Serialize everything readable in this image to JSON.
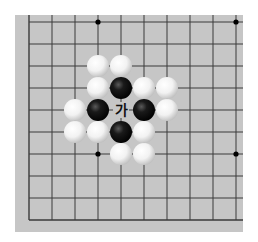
{
  "board": {
    "background_color": "#c6c6c6",
    "line_color": "#3a3a3a",
    "origin": {
      "x": 29,
      "y": 22
    },
    "spacing": {
      "x": 23,
      "y": 22
    },
    "columns": 10,
    "rows": 10,
    "edges": {
      "left": true,
      "top": false,
      "right": false,
      "bottom": true
    },
    "star_points": [
      {
        "col": 3,
        "row": 0
      },
      {
        "col": 9,
        "row": 0
      },
      {
        "col": 3,
        "row": 6
      },
      {
        "col": 9,
        "row": 6
      }
    ]
  },
  "stones": [
    {
      "color": "white",
      "col": 3,
      "row": 2
    },
    {
      "color": "white",
      "col": 4,
      "row": 2
    },
    {
      "color": "white",
      "col": 3,
      "row": 3
    },
    {
      "color": "black",
      "col": 4,
      "row": 3
    },
    {
      "color": "white",
      "col": 5,
      "row": 3
    },
    {
      "color": "white",
      "col": 6,
      "row": 3
    },
    {
      "color": "white",
      "col": 2,
      "row": 4
    },
    {
      "color": "black",
      "col": 3,
      "row": 4
    },
    {
      "color": "black",
      "col": 5,
      "row": 4
    },
    {
      "color": "white",
      "col": 6,
      "row": 4
    },
    {
      "color": "white",
      "col": 2,
      "row": 5
    },
    {
      "color": "white",
      "col": 3,
      "row": 5
    },
    {
      "color": "black",
      "col": 4,
      "row": 5
    },
    {
      "color": "white",
      "col": 5,
      "row": 5
    },
    {
      "color": "white",
      "col": 4,
      "row": 6
    },
    {
      "color": "white",
      "col": 5,
      "row": 6
    }
  ],
  "labels": [
    {
      "text": "가",
      "col": 4,
      "row": 4
    }
  ]
}
